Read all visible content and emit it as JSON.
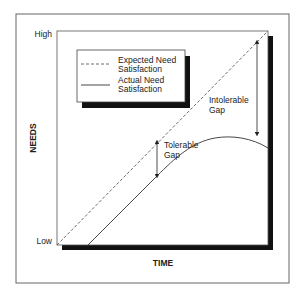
{
  "diagram": {
    "y_axis": {
      "label": "NEEDS",
      "high_label": "High",
      "low_label": "Low"
    },
    "x_axis": {
      "label": "TIME"
    },
    "legend": {
      "items": [
        {
          "style": "dashed",
          "line1": "Expected Need",
          "line2": "Satisfaction"
        },
        {
          "style": "solid",
          "line1": "Actual Need",
          "line2": "Satisfaction"
        }
      ]
    },
    "annotations": {
      "intolerable_gap": {
        "line1": "Intolerable",
        "line2": "Gap"
      },
      "tolerable_gap": {
        "line1": "Tolerable",
        "line2": "Gap"
      }
    },
    "colors": {
      "line": "#333333",
      "shadow": "#111111",
      "frame": "#555555"
    }
  }
}
